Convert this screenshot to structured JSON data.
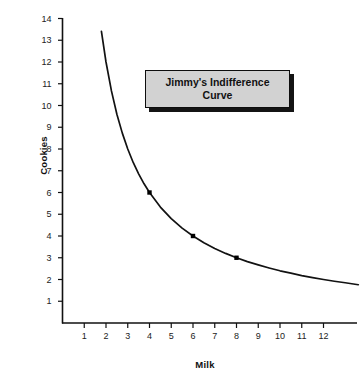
{
  "chart_data": {
    "type": "line",
    "title": "Jimmy's Indifference Curve",
    "title_line1": "Jimmy's Indifference",
    "title_line2": "Curve",
    "xlabel": "Milk",
    "ylabel": "Cookies",
    "xlim": [
      0,
      13.9
    ],
    "ylim": [
      0,
      14.6
    ],
    "grid": false,
    "legend": "none",
    "curve_equation": "x * y = 24",
    "curve_domain": [
      1.79,
      13.6
    ],
    "x_ticks": [
      1,
      2,
      3,
      4,
      5,
      6,
      7,
      8,
      9,
      10,
      11,
      12
    ],
    "y_ticks": [
      1,
      2,
      3,
      4,
      5,
      6,
      7,
      8,
      9,
      10,
      11,
      12,
      13,
      14
    ],
    "x": [
      1.79,
      2.0,
      2.25,
      2.5,
      2.75,
      3.0,
      3.25,
      3.5,
      3.75,
      4.0,
      4.5,
      5.0,
      5.5,
      6.0,
      6.5,
      7.0,
      7.5,
      8.0,
      8.5,
      9.0,
      9.5,
      10.0,
      10.5,
      11.0,
      11.5,
      12.0,
      12.5,
      13.0,
      13.6
    ],
    "y": [
      13.41,
      12.0,
      10.67,
      9.6,
      8.73,
      8.0,
      7.38,
      6.86,
      6.4,
      6.0,
      5.33,
      4.8,
      4.36,
      4.0,
      3.69,
      3.43,
      3.2,
      3.0,
      2.82,
      2.67,
      2.53,
      2.4,
      2.29,
      2.18,
      2.09,
      2.0,
      1.92,
      1.85,
      1.76
    ],
    "marked_points": [
      {
        "x": 4,
        "y": 6
      },
      {
        "x": 6,
        "y": 4
      },
      {
        "x": 8,
        "y": 3
      }
    ],
    "colors": {
      "curve": "#121212",
      "axis": "#111111",
      "marker": "#000000",
      "title_box_fill": "#d2d2d2",
      "title_box_border": "#0d0d0d",
      "title_box_shadow": "#141414",
      "background": "#ffffff"
    }
  }
}
